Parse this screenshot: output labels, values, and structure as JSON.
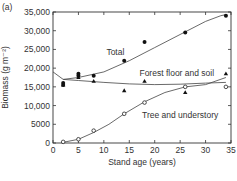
{
  "panel_label": "(a)",
  "chart_data": {
    "type": "scatter",
    "title": "",
    "xlabel": "Stand age (years)",
    "ylabel": "Biomass (g m⁻²)",
    "xlim": [
      0,
      35
    ],
    "ylim": [
      0,
      35000
    ],
    "xticks": [
      0,
      5,
      10,
      15,
      20,
      25,
      30,
      35
    ],
    "yticks": [
      0,
      5000,
      10000,
      15000,
      20000,
      25000,
      30000,
      35000
    ],
    "ytick_labels": [
      "0",
      "5000",
      "10,000",
      "15,000",
      "20,000",
      "25,000",
      "30,000",
      "35,000"
    ],
    "grid": false,
    "series": [
      {
        "name": "Total",
        "marker": "filled-circle",
        "points": [
          [
            2,
            16000
          ],
          [
            2,
            15500
          ],
          [
            5,
            18500
          ],
          [
            5,
            18000
          ],
          [
            8,
            18000
          ],
          [
            14,
            22000
          ],
          [
            18,
            27000
          ],
          [
            26,
            29500
          ],
          [
            34,
            34000
          ]
        ],
        "fit": [
          [
            2,
            17000
          ],
          [
            5,
            17500
          ],
          [
            10,
            19000
          ],
          [
            15,
            22000
          ],
          [
            20,
            25500
          ],
          [
            25,
            29000
          ],
          [
            30,
            32500
          ],
          [
            33,
            34000
          ],
          [
            34,
            34300
          ]
        ]
      },
      {
        "name": "Forest floor and soil",
        "marker": "filled-triangle",
        "points": [
          [
            2,
            15500
          ],
          [
            5,
            17500
          ],
          [
            8,
            16500
          ],
          [
            14,
            14000
          ],
          [
            18,
            16500
          ],
          [
            26,
            13500
          ],
          [
            34,
            18500
          ]
        ],
        "fit": [
          [
            0,
            19000
          ],
          [
            2,
            17000
          ],
          [
            5,
            16700
          ],
          [
            10,
            16200
          ],
          [
            15,
            15800
          ],
          [
            20,
            15600
          ],
          [
            25,
            15700
          ],
          [
            30,
            16000
          ],
          [
            34,
            16200
          ]
        ]
      },
      {
        "name": "Tree and understory",
        "marker": "open-circle",
        "points": [
          [
            2,
            300
          ],
          [
            5,
            1000
          ],
          [
            8,
            3300
          ],
          [
            14,
            7800
          ],
          [
            18,
            10800
          ],
          [
            26,
            15000
          ],
          [
            34,
            15000
          ]
        ],
        "fit": [
          [
            2,
            200
          ],
          [
            5,
            1000
          ],
          [
            8,
            2800
          ],
          [
            11,
            5000
          ],
          [
            14,
            7800
          ],
          [
            18,
            11000
          ],
          [
            22,
            13500
          ],
          [
            26,
            15000
          ],
          [
            30,
            15600
          ],
          [
            34,
            17500
          ]
        ]
      }
    ],
    "annotations": [
      "Total",
      "Forest floor and soil",
      "Tree and understory"
    ]
  }
}
